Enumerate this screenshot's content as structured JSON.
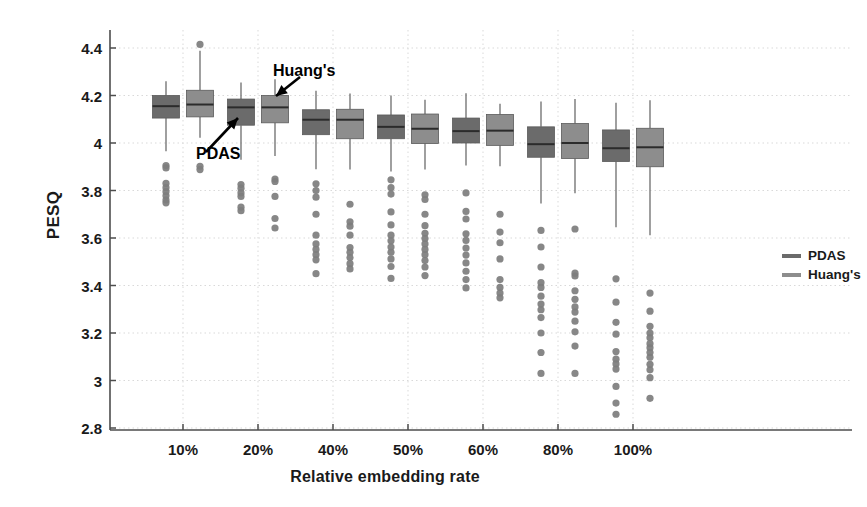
{
  "chart_data": {
    "type": "boxplot",
    "title": "",
    "xlabel": "Relative embedding rate",
    "ylabel": "PESQ",
    "categories": [
      "10%",
      "20%",
      "40%",
      "50%",
      "60%",
      "80%",
      "100%"
    ],
    "ylim": [
      2.8,
      4.4
    ],
    "yticks": [
      "4.4",
      "4.2",
      "4",
      "3.8",
      "3.6",
      "3.4",
      "3.2",
      "3",
      "2.8"
    ],
    "ytick_values": [
      4.4,
      4.2,
      4.0,
      3.8,
      3.6,
      3.4,
      3.2,
      3.0,
      2.8
    ],
    "grid": true,
    "legend_position": "right",
    "colors": {
      "pdas": "#6b6b6b",
      "huangs": "#8d8d8d",
      "median": "#2b2b2b",
      "whisker": "#777777",
      "outlier": "#7d7d7d",
      "axis": "#4d4d4d",
      "grid": "#d9d9d9"
    },
    "series": [
      {
        "name": "PDAS",
        "color": "#6b6b6b",
        "boxes": [
          {
            "category": "10%",
            "whisker_low": 3.965,
            "q1": 4.105,
            "median": 4.155,
            "q3": 4.2,
            "whisker_high": 4.26,
            "outliers": [
              3.905,
              3.895,
              3.83,
              3.812,
              3.795,
              3.778,
              3.76,
              3.748
            ]
          },
          {
            "category": "20%",
            "whisker_low": 3.93,
            "q1": 4.075,
            "median": 4.15,
            "q3": 4.185,
            "whisker_high": 4.255,
            "outliers": [
              3.825,
              3.81,
              3.79,
              3.775,
              3.73,
              3.715
            ]
          },
          {
            "category": "40%",
            "whisker_low": 3.89,
            "q1": 4.035,
            "median": 4.098,
            "q3": 4.14,
            "whisker_high": 4.22,
            "outliers": [
              3.828,
              3.8,
              3.772,
              3.7,
              3.612,
              3.575,
              3.552,
              3.53,
              3.508,
              3.45
            ]
          },
          {
            "category": "50%",
            "whisker_low": 3.88,
            "q1": 4.018,
            "median": 4.068,
            "q3": 4.118,
            "whisker_high": 4.2,
            "outliers": [
              3.845,
              3.812,
              3.785,
              3.71,
              3.655,
              3.612,
              3.588,
              3.562,
              3.54,
              3.512,
              3.48,
              3.43
            ]
          },
          {
            "category": "60%",
            "whisker_low": 3.905,
            "q1": 4.0,
            "median": 4.05,
            "q3": 4.105,
            "whisker_high": 4.21,
            "outliers": [
              3.79,
              3.712,
              3.68,
              3.618,
              3.59,
              3.558,
              3.528,
              3.495,
              3.46,
              3.425,
              3.39
            ]
          },
          {
            "category": "80%",
            "whisker_low": 3.745,
            "q1": 3.94,
            "median": 3.995,
            "q3": 4.068,
            "whisker_high": 4.175,
            "outliers": [
              3.632,
              3.562,
              3.478,
              3.412,
              3.392,
              3.355,
              3.322,
              3.298,
              3.265,
              3.2,
              3.118,
              3.03
            ]
          },
          {
            "category": "100%",
            "whisker_low": 3.645,
            "q1": 3.922,
            "median": 3.978,
            "q3": 4.055,
            "whisker_high": 4.17,
            "outliers": [
              3.428,
              3.33,
              3.245,
              3.195,
              3.122,
              3.09,
              3.07,
              3.048,
              2.975,
              2.905,
              2.858
            ]
          }
        ]
      },
      {
        "name": "Huang's",
        "color": "#8d8d8d",
        "boxes": [
          {
            "category": "10%",
            "whisker_low": 4.022,
            "q1": 4.11,
            "median": 4.162,
            "q3": 4.222,
            "whisker_high": 4.388,
            "outliers": [
              4.415,
              3.902,
              3.888
            ]
          },
          {
            "category": "20%",
            "whisker_low": 3.945,
            "q1": 4.085,
            "median": 4.15,
            "q3": 4.2,
            "whisker_high": 4.268,
            "outliers": [
              3.848,
              3.838,
              3.775,
              3.682,
              3.642
            ]
          },
          {
            "category": "40%",
            "whisker_low": 3.888,
            "q1": 4.018,
            "median": 4.098,
            "q3": 4.142,
            "whisker_high": 4.208,
            "outliers": [
              3.742,
              3.668,
              3.65,
              3.612,
              3.56,
              3.54,
              3.518,
              3.492,
              3.47
            ]
          },
          {
            "category": "50%",
            "whisker_low": 3.888,
            "q1": 3.998,
            "median": 4.06,
            "q3": 4.122,
            "whisker_high": 4.182,
            "outliers": [
              3.782,
              3.762,
              3.7,
              3.652,
              3.62,
              3.598,
              3.575,
              3.552,
              3.53,
              3.505,
              3.478,
              3.442
            ]
          },
          {
            "category": "60%",
            "whisker_low": 3.902,
            "q1": 3.99,
            "median": 4.052,
            "q3": 4.12,
            "whisker_high": 4.165,
            "outliers": [
              3.7,
              3.625,
              3.58,
              3.512,
              3.425,
              3.392,
              3.368,
              3.348
            ]
          },
          {
            "category": "80%",
            "whisker_low": 3.788,
            "q1": 3.935,
            "median": 4.0,
            "q3": 4.082,
            "whisker_high": 4.185,
            "outliers": [
              3.638,
              3.452,
              3.44,
              3.378,
              3.342,
              3.31,
              3.288,
              3.25,
              3.205,
              3.145,
              3.03
            ]
          },
          {
            "category": "100%",
            "whisker_low": 3.612,
            "q1": 3.9,
            "median": 3.982,
            "q3": 4.062,
            "whisker_high": 4.18,
            "outliers": [
              3.368,
              3.292,
              3.228,
              3.2,
              3.18,
              3.155,
              3.138,
              3.118,
              3.098,
              3.068,
              3.045,
              3.012,
              2.925
            ]
          }
        ]
      }
    ],
    "annotations": [
      {
        "id": "pdas",
        "text": "PDAS",
        "target_category": "20%",
        "target_series": "PDAS"
      },
      {
        "id": "huangs",
        "text": "Huang's",
        "target_category": "20%",
        "target_series": "Huang's"
      }
    ]
  },
  "legend": {
    "items": [
      {
        "label": "PDAS",
        "color": "#6b6b6b"
      },
      {
        "label": "Huang's",
        "color": "#8d8d8d"
      }
    ]
  }
}
